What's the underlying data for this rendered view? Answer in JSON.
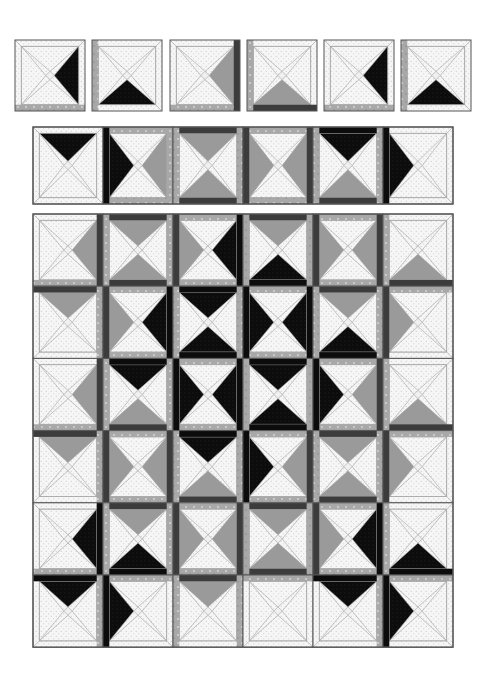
{
  "colors": {
    "background": "#ffffff",
    "white_fabric": "#f6f6f6",
    "dot": "#b8b8b8",
    "black_fabric": "#0c0c0c",
    "gray_fabric": "#9a9a9a",
    "dark_strip": "#3c3c3c",
    "mottled_strip": "#a8a8a8",
    "outline": "#555555",
    "seam": "#a0a0a0"
  },
  "legend_codes": {
    "w": "white dotted triangle",
    "k": "black triangle",
    "g": "gray triangle"
  },
  "unit_blocks": {
    "y": 40,
    "size": 70,
    "x_positions": [
      15,
      92,
      170,
      247,
      324,
      401
    ],
    "blocks": [
      {
        "t": "w",
        "r": "k",
        "b": "w",
        "l": "w",
        "strips": {
          "b": "m"
        }
      },
      {
        "t": "w",
        "r": "w",
        "b": "k",
        "l": "w",
        "strips": {
          "l": "m"
        }
      },
      {
        "t": "w",
        "r": "g",
        "b": "w",
        "l": "w",
        "strips": {
          "b": "m",
          "r": "d"
        }
      },
      {
        "t": "w",
        "r": "w",
        "b": "g",
        "l": "w",
        "strips": {
          "l": "m",
          "b": "d"
        }
      },
      {
        "t": "w",
        "r": "k",
        "b": "w",
        "l": "w",
        "strips": {
          "b": "m"
        }
      },
      {
        "t": "w",
        "r": "w",
        "b": "k",
        "l": "w",
        "strips": {
          "l": "m"
        }
      }
    ]
  },
  "strip_row": {
    "x": 33,
    "y": 127,
    "cell_w": 70,
    "cell_h": 77,
    "blocks": [
      {
        "t": "k",
        "r": "w",
        "b": "w",
        "l": "w",
        "strips": {}
      },
      {
        "t": "w",
        "r": "g",
        "b": "w",
        "l": "k",
        "strips": {
          "l": "k",
          "r": "m",
          "t": "m",
          "b": "m"
        }
      },
      {
        "t": "g",
        "r": "w",
        "b": "g",
        "l": "w",
        "strips": {
          "t": "d",
          "b": "d",
          "l": "m",
          "r": "m"
        }
      },
      {
        "t": "w",
        "r": "g",
        "b": "w",
        "l": "g",
        "strips": {
          "l": "d",
          "r": "d",
          "t": "m",
          "b": "m"
        }
      },
      {
        "t": "k",
        "r": "w",
        "b": "g",
        "l": "w",
        "strips": {
          "t": "k",
          "b": "d",
          "l": "m",
          "r": "m"
        }
      },
      {
        "t": "w",
        "r": "w",
        "b": "w",
        "l": "k",
        "strips": {
          "l": "k"
        }
      }
    ]
  },
  "quilt_grid": {
    "x": 33,
    "y": 214,
    "cell_w": 70,
    "cell_h": 72.2,
    "cols": 6,
    "rows": 6,
    "rows_data": [
      [
        {
          "t": "w",
          "r": "g",
          "b": "w",
          "l": "w",
          "strips": {
            "r": "d",
            "b": "m"
          }
        },
        {
          "t": "g",
          "r": "w",
          "b": "g",
          "l": "w",
          "strips": {
            "t": "d",
            "b": "d",
            "l": "m",
            "r": "m"
          }
        },
        {
          "t": "w",
          "r": "k",
          "b": "w",
          "l": "g",
          "strips": {
            "l": "d",
            "r": "k",
            "b": "m",
            "t": "m"
          }
        },
        {
          "t": "g",
          "r": "w",
          "b": "k",
          "l": "w",
          "strips": {
            "t": "d",
            "b": "k",
            "l": "m",
            "r": "m"
          }
        },
        {
          "t": "w",
          "r": "g",
          "b": "w",
          "l": "g",
          "strips": {
            "l": "d",
            "r": "d",
            "t": "m",
            "b": "m"
          }
        },
        {
          "t": "w",
          "r": "w",
          "b": "g",
          "l": "w",
          "strips": {
            "b": "d",
            "l": "m"
          }
        }
      ],
      [
        {
          "t": "g",
          "r": "w",
          "b": "w",
          "l": "w",
          "strips": {
            "t": "d",
            "r": "m"
          }
        },
        {
          "t": "w",
          "r": "k",
          "b": "w",
          "l": "g",
          "strips": {
            "l": "d",
            "r": "k",
            "t": "m",
            "b": "m"
          }
        },
        {
          "t": "k",
          "r": "w",
          "b": "k",
          "l": "w",
          "strips": {
            "t": "k",
            "b": "k",
            "l": "m",
            "r": "m"
          }
        },
        {
          "t": "w",
          "r": "k",
          "b": "w",
          "l": "k",
          "strips": {
            "l": "k",
            "r": "k",
            "t": "m",
            "b": "m"
          }
        },
        {
          "t": "g",
          "r": "w",
          "b": "k",
          "l": "w",
          "strips": {
            "t": "d",
            "b": "k",
            "l": "m",
            "r": "m"
          }
        },
        {
          "t": "w",
          "r": "w",
          "b": "w",
          "l": "g",
          "strips": {
            "l": "d",
            "t": "m"
          }
        }
      ],
      [
        {
          "t": "w",
          "r": "g",
          "b": "w",
          "l": "w",
          "strips": {
            "r": "d",
            "b": "m"
          }
        },
        {
          "t": "k",
          "r": "w",
          "b": "g",
          "l": "w",
          "strips": {
            "t": "k",
            "b": "d",
            "l": "m",
            "r": "m"
          }
        },
        {
          "t": "w",
          "r": "k",
          "b": "w",
          "l": "k",
          "strips": {
            "l": "k",
            "r": "k",
            "t": "m",
            "b": "m"
          }
        },
        {
          "t": "k",
          "r": "w",
          "b": "k",
          "l": "w",
          "strips": {
            "t": "k",
            "b": "k",
            "l": "m",
            "r": "m"
          }
        },
        {
          "t": "w",
          "r": "g",
          "b": "w",
          "l": "k",
          "strips": {
            "l": "k",
            "r": "d",
            "t": "m",
            "b": "m"
          }
        },
        {
          "t": "w",
          "r": "w",
          "b": "g",
          "l": "w",
          "strips": {
            "b": "d",
            "l": "m"
          }
        }
      ],
      [
        {
          "t": "g",
          "r": "w",
          "b": "w",
          "l": "w",
          "strips": {
            "t": "d",
            "r": "m"
          }
        },
        {
          "t": "w",
          "r": "g",
          "b": "w",
          "l": "g",
          "strips": {
            "l": "d",
            "r": "d",
            "t": "m",
            "b": "m"
          }
        },
        {
          "t": "k",
          "r": "w",
          "b": "g",
          "l": "w",
          "strips": {
            "t": "k",
            "b": "d",
            "l": "m",
            "r": "m"
          }
        },
        {
          "t": "w",
          "r": "g",
          "b": "w",
          "l": "k",
          "strips": {
            "l": "k",
            "r": "d",
            "t": "m",
            "b": "m"
          }
        },
        {
          "t": "g",
          "r": "w",
          "b": "g",
          "l": "w",
          "strips": {
            "t": "d",
            "b": "d",
            "l": "m",
            "r": "m"
          }
        },
        {
          "t": "w",
          "r": "w",
          "b": "w",
          "l": "g",
          "strips": {
            "l": "d",
            "t": "m"
          }
        }
      ],
      [
        {
          "t": "w",
          "r": "k",
          "b": "w",
          "l": "w",
          "strips": {
            "r": "k",
            "b": "m"
          }
        },
        {
          "t": "g",
          "r": "w",
          "b": "k",
          "l": "w",
          "strips": {
            "t": "d",
            "b": "k",
            "l": "m",
            "r": "m"
          }
        },
        {
          "t": "w",
          "r": "g",
          "b": "w",
          "l": "g",
          "strips": {
            "l": "d",
            "r": "d",
            "t": "m",
            "b": "m"
          }
        },
        {
          "t": "g",
          "r": "w",
          "b": "g",
          "l": "w",
          "strips": {
            "t": "d",
            "b": "d",
            "l": "m",
            "r": "m"
          }
        },
        {
          "t": "w",
          "r": "k",
          "b": "w",
          "l": "g",
          "strips": {
            "l": "d",
            "r": "k",
            "t": "m",
            "b": "m"
          }
        },
        {
          "t": "w",
          "r": "w",
          "b": "k",
          "l": "w",
          "strips": {
            "b": "k",
            "l": "m"
          }
        }
      ],
      [
        {
          "t": "k",
          "r": "w",
          "b": "w",
          "l": "w",
          "strips": {
            "t": "k",
            "r": "m"
          }
        },
        {
          "t": "w",
          "r": "w",
          "b": "w",
          "l": "k",
          "strips": {
            "l": "k",
            "t": "m"
          }
        },
        {
          "t": "g",
          "r": "w",
          "b": "w",
          "l": "w",
          "strips": {
            "t": "d",
            "l": "m",
            "r": "m"
          }
        },
        {
          "t": "w",
          "r": "w",
          "b": "w",
          "l": "w",
          "strips": {
            "t": "m"
          }
        },
        {
          "t": "k",
          "r": "w",
          "b": "w",
          "l": "w",
          "strips": {
            "t": "k",
            "r": "m"
          }
        },
        {
          "t": "w",
          "r": "w",
          "b": "w",
          "l": "k",
          "strips": {
            "l": "k",
            "t": "m"
          }
        }
      ]
    ]
  }
}
